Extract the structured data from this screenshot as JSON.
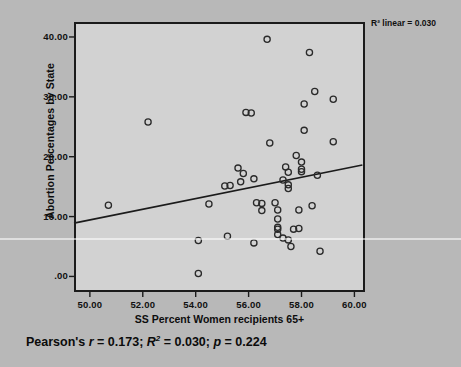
{
  "figure": {
    "background_color": "#b8b8b8",
    "plot_background_color": "#d2d2d2",
    "frame_color": "#1b1b1b"
  },
  "annotation": {
    "r2_linear": "R² linear = 0.030"
  },
  "caption": {
    "full_text": "Pearson's r = 0.173; R² = 0.030; p = 0.224",
    "pearson_r": "0.173",
    "r_squared": "0.030",
    "p_value": "0.224"
  },
  "chart_data": {
    "type": "scatter",
    "title": "",
    "xlabel": "SS Percent Women recipients 65+",
    "ylabel": "Abortion Percentages by State",
    "xlim": [
      49.4,
      60.4
    ],
    "ylim": [
      -2.6,
      42.5
    ],
    "xticks": [
      50,
      52,
      54,
      56,
      58,
      60
    ],
    "xticklabels": [
      "50.00",
      "52.00",
      "54.00",
      "56.00",
      "58.00",
      "60.00"
    ],
    "yticks": [
      0,
      10,
      20,
      30,
      40
    ],
    "yticklabels": [
      ".00",
      "10.00",
      "20.00",
      "30.00",
      "40.00"
    ],
    "grid": false,
    "legend": "none",
    "marker": "open-circle",
    "marker_color": "#2a2a2a",
    "fit_line": {
      "type": "linear",
      "color": "#1b1b1b",
      "x_start": 49.4,
      "y_start": 8.9,
      "x_end": 60.3,
      "y_end": 18.6,
      "slope": 0.89,
      "intercept": -35.06
    },
    "points": [
      {
        "x": 50.7,
        "y": 11.9
      },
      {
        "x": 52.2,
        "y": 25.8
      },
      {
        "x": 54.1,
        "y": 0.5
      },
      {
        "x": 54.1,
        "y": 6.0
      },
      {
        "x": 54.5,
        "y": 12.1
      },
      {
        "x": 55.1,
        "y": 15.1
      },
      {
        "x": 55.2,
        "y": 6.7
      },
      {
        "x": 55.3,
        "y": 15.2
      },
      {
        "x": 55.6,
        "y": 18.1
      },
      {
        "x": 55.7,
        "y": 15.8
      },
      {
        "x": 55.8,
        "y": 17.2
      },
      {
        "x": 55.9,
        "y": 27.4
      },
      {
        "x": 56.1,
        "y": 27.3
      },
      {
        "x": 56.2,
        "y": 16.3
      },
      {
        "x": 56.2,
        "y": 5.6
      },
      {
        "x": 56.3,
        "y": 12.3
      },
      {
        "x": 56.5,
        "y": 12.2
      },
      {
        "x": 56.5,
        "y": 11.0
      },
      {
        "x": 56.7,
        "y": 39.6
      },
      {
        "x": 56.8,
        "y": 22.3
      },
      {
        "x": 57.0,
        "y": 12.3
      },
      {
        "x": 57.1,
        "y": 11.1
      },
      {
        "x": 57.1,
        "y": 9.6
      },
      {
        "x": 57.1,
        "y": 8.2
      },
      {
        "x": 57.1,
        "y": 7.9
      },
      {
        "x": 57.1,
        "y": 7.0
      },
      {
        "x": 57.3,
        "y": 6.4
      },
      {
        "x": 57.3,
        "y": 16.1
      },
      {
        "x": 57.4,
        "y": 18.3
      },
      {
        "x": 57.5,
        "y": 6.1
      },
      {
        "x": 57.5,
        "y": 15.3
      },
      {
        "x": 57.5,
        "y": 14.7
      },
      {
        "x": 57.5,
        "y": 17.4
      },
      {
        "x": 57.6,
        "y": 5.0
      },
      {
        "x": 57.7,
        "y": 7.9
      },
      {
        "x": 57.8,
        "y": 20.2
      },
      {
        "x": 57.9,
        "y": 8.0
      },
      {
        "x": 57.9,
        "y": 11.1
      },
      {
        "x": 58.0,
        "y": 19.1
      },
      {
        "x": 58.0,
        "y": 17.9
      },
      {
        "x": 58.0,
        "y": 17.5
      },
      {
        "x": 58.1,
        "y": 28.8
      },
      {
        "x": 58.1,
        "y": 24.4
      },
      {
        "x": 58.3,
        "y": 37.4
      },
      {
        "x": 58.4,
        "y": 11.8
      },
      {
        "x": 58.5,
        "y": 30.9
      },
      {
        "x": 58.6,
        "y": 16.9
      },
      {
        "x": 58.7,
        "y": 4.2
      },
      {
        "x": 59.2,
        "y": 29.6
      },
      {
        "x": 59.2,
        "y": 22.5
      }
    ]
  }
}
